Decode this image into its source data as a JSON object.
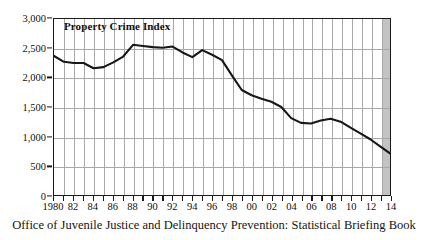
{
  "chart_data": {
    "type": "line",
    "title": "Property Crime Index",
    "xlabel": "",
    "ylabel": "",
    "xlim": [
      1980,
      2014
    ],
    "ylim": [
      0,
      3000
    ],
    "grid": true,
    "legend": false,
    "y_ticks": [
      0,
      500,
      1000,
      1500,
      2000,
      2500,
      3000
    ],
    "y_tick_labels": [
      "0",
      "500",
      "1,000",
      "1,500",
      "2,000",
      "2,500",
      "3,000"
    ],
    "x_ticks": [
      1980,
      1981,
      1982,
      1983,
      1984,
      1985,
      1986,
      1987,
      1988,
      1989,
      1990,
      1991,
      1992,
      1993,
      1994,
      1995,
      1996,
      1997,
      1998,
      1999,
      2000,
      2001,
      2002,
      2003,
      2004,
      2005,
      2006,
      2007,
      2008,
      2009,
      2010,
      2011,
      2012,
      2013,
      2014
    ],
    "x_tick_labels": [
      {
        "year": 1980,
        "label": "1980"
      },
      {
        "year": 1982,
        "label": "82"
      },
      {
        "year": 1984,
        "label": "84"
      },
      {
        "year": 1986,
        "label": "86"
      },
      {
        "year": 1988,
        "label": "88"
      },
      {
        "year": 1990,
        "label": "90"
      },
      {
        "year": 1992,
        "label": "92"
      },
      {
        "year": 1994,
        "label": "94"
      },
      {
        "year": 1996,
        "label": "96"
      },
      {
        "year": 1998,
        "label": "98"
      },
      {
        "year": 2000,
        "label": "00"
      },
      {
        "year": 2002,
        "label": "02"
      },
      {
        "year": 2004,
        "label": "04"
      },
      {
        "year": 2006,
        "label": "06"
      },
      {
        "year": 2008,
        "label": "08"
      },
      {
        "year": 2010,
        "label": "10"
      },
      {
        "year": 2012,
        "label": "12"
      },
      {
        "year": 2014,
        "label": "14"
      }
    ],
    "shaded_band": {
      "from": 2013,
      "to": 2014,
      "color": "#c3c3c3"
    },
    "series": [
      {
        "name": "Property Crime Index",
        "color": "#171717",
        "x": [
          1980,
          1981,
          1982,
          1983,
          1984,
          1985,
          1986,
          1987,
          1988,
          1989,
          1990,
          1991,
          1992,
          1993,
          1994,
          1995,
          1996,
          1997,
          1998,
          1999,
          2000,
          2001,
          2002,
          2003,
          2004,
          2005,
          2006,
          2007,
          2008,
          2009,
          2010,
          2011,
          2012,
          2013,
          2014
        ],
        "values": [
          2370,
          2270,
          2250,
          2250,
          2160,
          2180,
          2260,
          2360,
          2560,
          2540,
          2520,
          2510,
          2530,
          2430,
          2350,
          2470,
          2390,
          2300,
          2040,
          1790,
          1700,
          1640,
          1590,
          1500,
          1310,
          1230,
          1220,
          1270,
          1300,
          1250,
          1150,
          1050,
          950,
          830,
          710
        ]
      }
    ]
  },
  "source_note": "Office of Juvenile Justice and Delinquency Prevention: Statistical Briefing Book"
}
